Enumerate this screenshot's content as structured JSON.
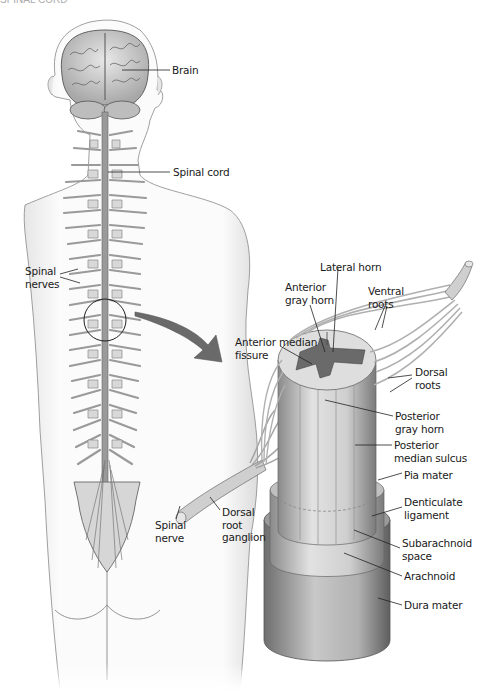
{
  "figure": {
    "top_fragment": "SPINAL CORD",
    "body_labels": [
      {
        "id": "brain",
        "text": "Brain",
        "x": 172,
        "y": 64
      },
      {
        "id": "spinal-cord",
        "text": "Spinal cord",
        "x": 173,
        "y": 166
      },
      {
        "id": "spinal-nerves",
        "text": "Spinal\nnerves",
        "x": 25,
        "y": 265
      }
    ],
    "section_labels": [
      {
        "id": "lateral-horn",
        "text": "Lateral horn",
        "x": 320,
        "y": 261
      },
      {
        "id": "anterior-gray-horn",
        "text": "Anterior\ngray horn",
        "x": 285,
        "y": 281
      },
      {
        "id": "ventral-roots",
        "text": "Ventral\nroots",
        "x": 368,
        "y": 285
      },
      {
        "id": "anterior-median-fissure",
        "text": "Anterior median\nfissure",
        "x": 235,
        "y": 336
      },
      {
        "id": "dorsal-roots",
        "text": "Dorsal\nroots",
        "x": 415,
        "y": 366
      },
      {
        "id": "posterior-gray-horn",
        "text": "Posterior\ngray horn",
        "x": 395,
        "y": 410
      },
      {
        "id": "posterior-median-sulcus",
        "text": "Posterior\nmedian sulcus",
        "x": 394,
        "y": 439
      },
      {
        "id": "pia-mater",
        "text": "Pia mater",
        "x": 404,
        "y": 469
      },
      {
        "id": "denticulate-ligament",
        "text": "Denticulate\nligament",
        "x": 404,
        "y": 496
      },
      {
        "id": "subarachnoid-space",
        "text": "Subarachnoid\nspace",
        "x": 402,
        "y": 537
      },
      {
        "id": "arachnoid",
        "text": "Arachnoid",
        "x": 404,
        "y": 570
      },
      {
        "id": "dura-mater",
        "text": "Dura mater",
        "x": 404,
        "y": 599
      },
      {
        "id": "spinal-nerve",
        "text": "Spinal\nnerve",
        "x": 155,
        "y": 519
      },
      {
        "id": "dorsal-root-ganglion",
        "text": "Dorsal\nroot\nganglion",
        "x": 222,
        "y": 506
      }
    ]
  }
}
